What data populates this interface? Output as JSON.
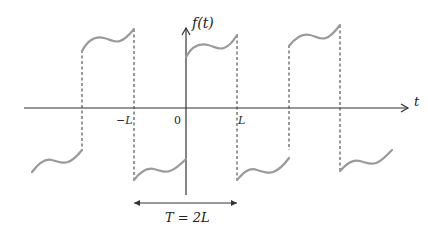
{
  "diagram": {
    "y_axis_label": "f(t)",
    "x_axis_label": "t",
    "tick_labels": {
      "neg_L": "−L",
      "origin": "0",
      "pos_L": "L"
    },
    "period_label": "T = 2L",
    "colors": {
      "curve": "#9a9a9a",
      "axis": "#333333",
      "dashed": "#333333"
    }
  }
}
